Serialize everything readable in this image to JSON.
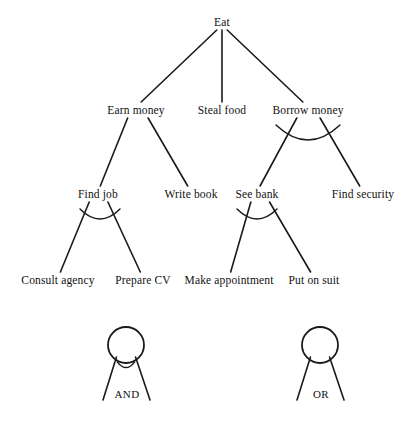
{
  "diagram": {
    "type": "and-or-tree",
    "stroke_color": "#1a1a1a",
    "background_color": "#ffffff",
    "nodes": [
      {
        "id": "eat",
        "label": "Eat",
        "x": 222,
        "y": 22,
        "level": 0,
        "decomposition": "or"
      },
      {
        "id": "earn-money",
        "label": "Earn money",
        "x": 136,
        "y": 110,
        "level": 1,
        "decomposition": "or"
      },
      {
        "id": "steal-food",
        "label": "Steal food",
        "x": 222,
        "y": 110,
        "level": 1,
        "decomposition": "leaf"
      },
      {
        "id": "borrow-money",
        "label": "Borrow money",
        "x": 308,
        "y": 110,
        "level": 1,
        "decomposition": "and"
      },
      {
        "id": "find-job",
        "label": "Find job",
        "x": 98,
        "y": 194,
        "level": 2,
        "decomposition": "and"
      },
      {
        "id": "write-book",
        "label": "Write book",
        "x": 191,
        "y": 194,
        "level": 2,
        "decomposition": "leaf"
      },
      {
        "id": "see-bank",
        "label": "See bank",
        "x": 257,
        "y": 194,
        "level": 2,
        "decomposition": "and"
      },
      {
        "id": "find-security",
        "label": "Find security",
        "x": 363,
        "y": 194,
        "level": 2,
        "decomposition": "leaf"
      },
      {
        "id": "consult-agency",
        "label": "Consult agency",
        "x": 58,
        "y": 280,
        "level": 3,
        "decomposition": "leaf"
      },
      {
        "id": "prepare-cv",
        "label": "Prepare CV",
        "x": 143,
        "y": 280,
        "level": 3,
        "decomposition": "leaf"
      },
      {
        "id": "make-appointment",
        "label": "Make appointment",
        "x": 229,
        "y": 280,
        "level": 3,
        "decomposition": "leaf"
      },
      {
        "id": "put-on-suit",
        "label": "Put on suit",
        "x": 314,
        "y": 280,
        "level": 3,
        "decomposition": "leaf"
      }
    ],
    "edges": [
      {
        "from": "eat",
        "to": "earn-money"
      },
      {
        "from": "eat",
        "to": "steal-food"
      },
      {
        "from": "eat",
        "to": "borrow-money"
      },
      {
        "from": "earn-money",
        "to": "find-job"
      },
      {
        "from": "earn-money",
        "to": "write-book"
      },
      {
        "from": "borrow-money",
        "to": "see-bank"
      },
      {
        "from": "borrow-money",
        "to": "find-security"
      },
      {
        "from": "find-job",
        "to": "consult-agency"
      },
      {
        "from": "find-job",
        "to": "prepare-cv"
      },
      {
        "from": "see-bank",
        "to": "make-appointment"
      },
      {
        "from": "see-bank",
        "to": "put-on-suit"
      }
    ],
    "and_arcs": [
      {
        "parent": "borrow-money",
        "x1": 276,
        "y1": 125,
        "x2": 340,
        "y2": 125,
        "dip": 15
      },
      {
        "parent": "find-job",
        "x1": 80,
        "y1": 209,
        "x2": 120,
        "y2": 209,
        "dip": 10
      },
      {
        "parent": "see-bank",
        "x1": 237,
        "y1": 209,
        "x2": 277,
        "y2": 209,
        "dip": 10
      }
    ]
  },
  "legend": {
    "items": [
      {
        "id": "and-symbol",
        "label": "AND",
        "cx": 126,
        "cy": 345,
        "r": 18,
        "has_arc": true,
        "left_end_x": 103,
        "left_end_y": 400,
        "right_end_x": 150,
        "right_end_y": 400,
        "label_x": 127,
        "label_y": 394
      },
      {
        "id": "or-symbol",
        "label": "OR",
        "cx": 320,
        "cy": 345,
        "r": 18,
        "has_arc": false,
        "left_end_x": 297,
        "left_end_y": 400,
        "right_end_x": 344,
        "right_end_y": 400,
        "label_x": 321,
        "label_y": 394
      }
    ]
  }
}
